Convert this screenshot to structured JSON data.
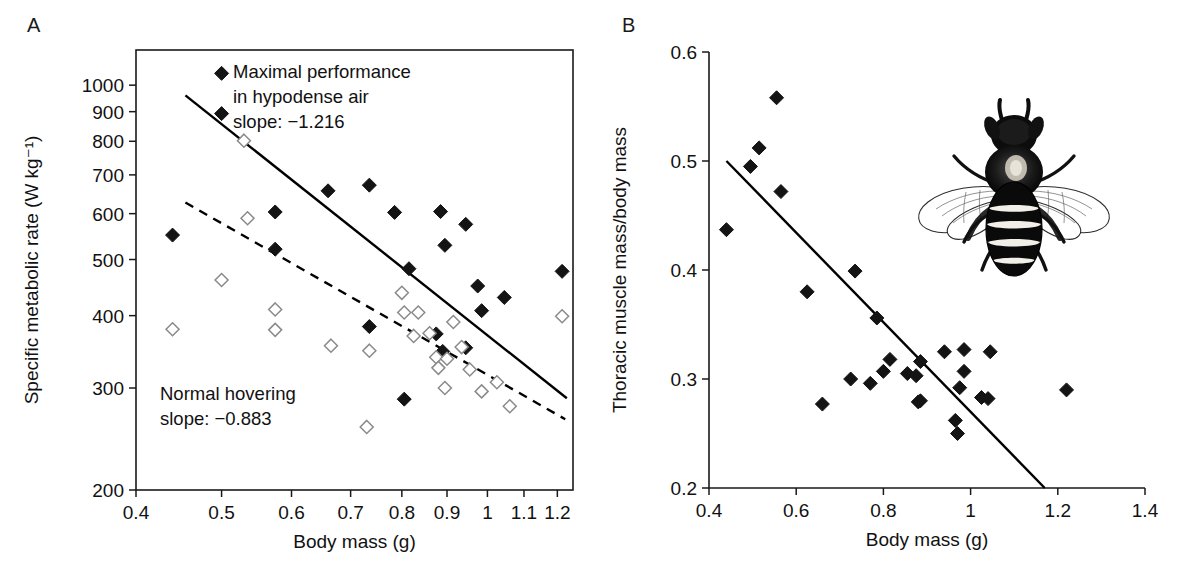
{
  "figure": {
    "panels": [
      {
        "letter": "A",
        "xlabel": "Body mass (g)",
        "ylabel": "Specific metabolic rate (W kg⁻¹)",
        "annotations": [
          {
            "name": "maximal-performance-note",
            "lines": [
              "Maximal performance",
              "in hypodense air",
              "slope: −1.216"
            ]
          },
          {
            "name": "normal-hovering-note",
            "lines": [
              "Normal hovering",
              "slope: −0.883"
            ]
          }
        ]
      },
      {
        "letter": "B",
        "xlabel": "Body mass (g)",
        "ylabel": "Thoracic muscle mass/body mass",
        "illustration": "bumblebee-illustration"
      }
    ]
  },
  "chart_data": [
    {
      "type": "scatter",
      "panel": "A",
      "title": "",
      "xlabel": "Body mass (g)",
      "ylabel": "Specific metabolic rate (W kg⁻¹)",
      "xscale": "log",
      "yscale": "log",
      "xlim": [
        0.4,
        1.25
      ],
      "ylim": [
        200,
        1150
      ],
      "xticks": [
        0.4,
        0.5,
        0.6,
        0.7,
        0.8,
        0.9,
        1,
        1.1,
        1.2
      ],
      "xticklabels": [
        "0.4",
        "0.5",
        "0.6",
        "0.7",
        "0.8",
        "0.9",
        "1",
        "1.1",
        "1.2"
      ],
      "yticks": [
        200,
        300,
        400,
        500,
        600,
        700,
        800,
        900,
        1000
      ],
      "yticklabels": [
        "200",
        "300",
        "400",
        "500",
        "600",
        "700",
        "800",
        "900",
        "1000"
      ],
      "grid": false,
      "legend": "none",
      "series": [
        {
          "name": "Maximal performance in hypodense air",
          "marker": "filled-diamond",
          "slope": -1.216,
          "points": [
            [
              0.44,
              551
            ],
            [
              0.5,
              1048
            ],
            [
              0.5,
              893
            ],
            [
              0.575,
              604
            ],
            [
              0.575,
              521
            ],
            [
              0.66,
              657
            ],
            [
              0.735,
              672
            ],
            [
              0.735,
              383
            ],
            [
              0.785,
              603
            ],
            [
              0.805,
              287
            ],
            [
              0.815,
              482
            ],
            [
              0.875,
              372
            ],
            [
              0.885,
              605
            ],
            [
              0.89,
              347
            ],
            [
              0.895,
              529
            ],
            [
              0.945,
              575
            ],
            [
              0.945,
              352
            ],
            [
              0.975,
              450
            ],
            [
              0.985,
              408
            ],
            [
              1.045,
              430
            ],
            [
              1.215,
              477
            ]
          ]
        },
        {
          "name": "Normal hovering",
          "marker": "open-diamond",
          "slope": -0.883,
          "points": [
            [
              0.44,
              379
            ],
            [
              0.5,
              461
            ],
            [
              0.53,
              802
            ],
            [
              0.535,
              589
            ],
            [
              0.575,
              410
            ],
            [
              0.575,
              378
            ],
            [
              0.665,
              355
            ],
            [
              0.73,
              257
            ],
            [
              0.735,
              348
            ],
            [
              0.8,
              438
            ],
            [
              0.805,
              405
            ],
            [
              0.825,
              369
            ],
            [
              0.835,
              405
            ],
            [
              0.86,
              373
            ],
            [
              0.875,
              339
            ],
            [
              0.88,
              325
            ],
            [
              0.895,
              300
            ],
            [
              0.9,
              337
            ],
            [
              0.915,
              390
            ],
            [
              0.935,
              353
            ],
            [
              0.955,
              323
            ],
            [
              0.985,
              296
            ],
            [
              1.025,
              307
            ],
            [
              1.06,
              279
            ],
            [
              1.215,
              399
            ]
          ]
        }
      ],
      "fit_lines": [
        {
          "name": "maximal-performance-fit",
          "style": "solid",
          "x": [
            0.455,
            1.23
          ],
          "y": [
            960,
            288
          ]
        },
        {
          "name": "normal-hovering-fit",
          "style": "dashed",
          "x": [
            0.455,
            1.225
          ],
          "y": [
            627,
            265
          ]
        }
      ]
    },
    {
      "type": "scatter",
      "panel": "B",
      "title": "",
      "xlabel": "Body mass (g)",
      "ylabel": "Thoracic muscle mass/body mass",
      "xscale": "linear",
      "yscale": "linear",
      "xlim": [
        0.4,
        1.4
      ],
      "ylim": [
        0.2,
        0.6
      ],
      "xticks": [
        0.4,
        0.6,
        0.8,
        1.0,
        1.2,
        1.4
      ],
      "xticklabels": [
        "0.4",
        "0.6",
        "0.8",
        "1",
        "1.2",
        "1.4"
      ],
      "yticks": [
        0.2,
        0.3,
        0.4,
        0.5,
        0.6
      ],
      "yticklabels": [
        "0.2",
        "0.3",
        "0.4",
        "0.5",
        "0.6"
      ],
      "grid": false,
      "legend": "none",
      "series": [
        {
          "name": "Thoracic muscle mass ratio",
          "marker": "filled-diamond",
          "points": [
            [
              0.44,
              0.437
            ],
            [
              0.495,
              0.495
            ],
            [
              0.515,
              0.512
            ],
            [
              0.555,
              0.558
            ],
            [
              0.565,
              0.472
            ],
            [
              0.625,
              0.38
            ],
            [
              0.66,
              0.277
            ],
            [
              0.725,
              0.3
            ],
            [
              0.735,
              0.399
            ],
            [
              0.77,
              0.296
            ],
            [
              0.785,
              0.356
            ],
            [
              0.8,
              0.307
            ],
            [
              0.815,
              0.318
            ],
            [
              0.855,
              0.305
            ],
            [
              0.875,
              0.303
            ],
            [
              0.88,
              0.279
            ],
            [
              0.885,
              0.316
            ],
            [
              0.885,
              0.28
            ],
            [
              0.94,
              0.325
            ],
            [
              0.965,
              0.262
            ],
            [
              0.97,
              0.25
            ],
            [
              0.975,
              0.292
            ],
            [
              0.985,
              0.327
            ],
            [
              0.985,
              0.307
            ],
            [
              1.025,
              0.283
            ],
            [
              1.04,
              0.282
            ],
            [
              1.045,
              0.325
            ],
            [
              1.22,
              0.29
            ]
          ]
        }
      ],
      "fit_lines": [
        {
          "name": "muscle-mass-fit",
          "style": "solid",
          "x": [
            0.44,
            1.17
          ],
          "y": [
            0.5,
            0.2
          ]
        }
      ]
    }
  ]
}
